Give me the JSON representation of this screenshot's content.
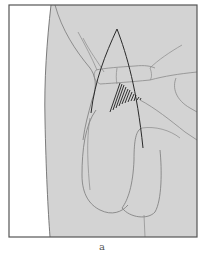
{
  "figure": {
    "label": "a",
    "colors": {
      "background": "#ffffff",
      "skin_fill": "#d3d3d3",
      "frame": "#555555",
      "contour": "#7a7a7a",
      "incision": "#2a2a2a",
      "hatch": "#1e1e1e"
    }
  }
}
